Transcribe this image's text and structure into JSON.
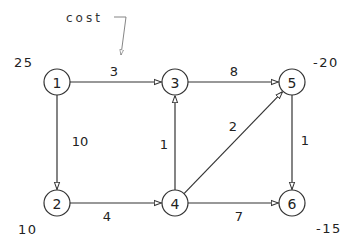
{
  "diagram": {
    "type": "directed-network-flow-graph",
    "annotation": {
      "text": "cost",
      "points_to": "edge 1->3 cost label"
    },
    "nodes": [
      {
        "id": "1",
        "label": "1",
        "x": 57,
        "y": 82,
        "supply": "25",
        "supply_x": 14,
        "supply_y": 62
      },
      {
        "id": "2",
        "label": "2",
        "x": 57,
        "y": 203,
        "supply": "10",
        "supply_x": 18,
        "supply_y": 229
      },
      {
        "id": "3",
        "label": "3",
        "x": 175,
        "y": 82,
        "supply": null
      },
      {
        "id": "4",
        "label": "4",
        "x": 175,
        "y": 203,
        "supply": null
      },
      {
        "id": "5",
        "label": "5",
        "x": 292,
        "y": 82,
        "supply": "-20",
        "supply_x": 313,
        "supply_y": 62
      },
      {
        "id": "6",
        "label": "6",
        "x": 292,
        "y": 203,
        "supply": "-15",
        "supply_x": 316,
        "supply_y": 228
      }
    ],
    "edges": [
      {
        "from": "1",
        "to": "3",
        "cost": "3",
        "label_x": 114,
        "label_y": 71
      },
      {
        "from": "1",
        "to": "2",
        "cost": "10",
        "label_x": 80,
        "label_y": 141
      },
      {
        "from": "3",
        "to": "5",
        "cost": "8",
        "label_x": 234,
        "label_y": 71
      },
      {
        "from": "4",
        "to": "3",
        "cost": "1",
        "label_x": 164,
        "label_y": 144
      },
      {
        "from": "4",
        "to": "5",
        "cost": "2",
        "label_x": 233,
        "label_y": 126
      },
      {
        "from": "5",
        "to": "6",
        "cost": "1",
        "label_x": 305,
        "label_y": 140
      },
      {
        "from": "2",
        "to": "4",
        "cost": "4",
        "label_x": 107,
        "label_y": 216
      },
      {
        "from": "4",
        "to": "6",
        "cost": "7",
        "label_x": 239,
        "label_y": 216
      }
    ]
  }
}
